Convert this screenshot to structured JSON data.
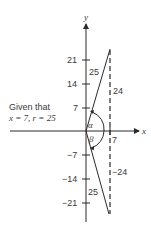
{
  "diagram": {
    "axes": {
      "x_label": "x",
      "y_label": "y"
    },
    "y_ticks": [
      "21",
      "14",
      "7",
      "−7",
      "−14",
      "−21"
    ],
    "x_tick": "7",
    "upper_triangle": {
      "hypotenuse": "25",
      "vertical_side": "24",
      "angle": "α"
    },
    "lower_triangle": {
      "hypotenuse": "25",
      "vertical_side": "−24",
      "angle": "β"
    },
    "given": {
      "line1": "Given that",
      "line2": "x = 7, r = 25"
    },
    "colors": {
      "ink": "#3a3a3a",
      "background": "#ffffff"
    }
  }
}
